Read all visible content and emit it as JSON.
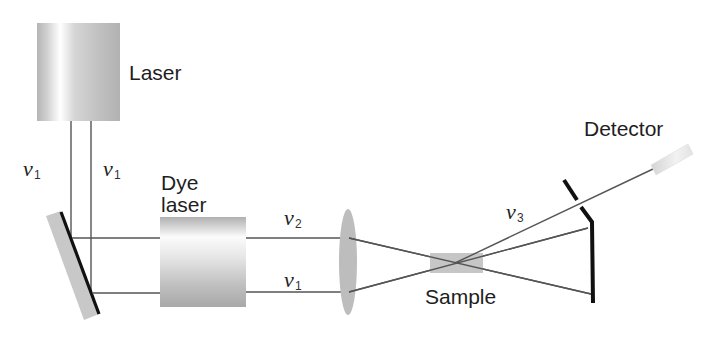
{
  "diagram": {
    "components": {
      "laser": {
        "label": "Laser"
      },
      "dye_laser": {
        "label_line1": "Dye",
        "label_line2": "laser"
      },
      "lens": {
        "label": ""
      },
      "sample": {
        "label": "Sample"
      },
      "detector": {
        "label": "Detector"
      },
      "beam_splitter_mirror": {
        "label": ""
      },
      "output_mirror": {
        "label": ""
      }
    },
    "beams": {
      "laser_left": {
        "symbol": "ν",
        "subscript": "1"
      },
      "laser_right": {
        "symbol": "ν",
        "subscript": "1"
      },
      "dye_out_upper": {
        "symbol": "ν",
        "subscript": "2"
      },
      "pump_lower": {
        "symbol": "ν",
        "subscript": "1"
      },
      "signal": {
        "symbol": "ν",
        "subscript": "3"
      }
    },
    "colors": {
      "beam": "#555555",
      "mirror": "#111111",
      "component_gray": "#b8b8b8",
      "background": "#ffffff"
    }
  }
}
